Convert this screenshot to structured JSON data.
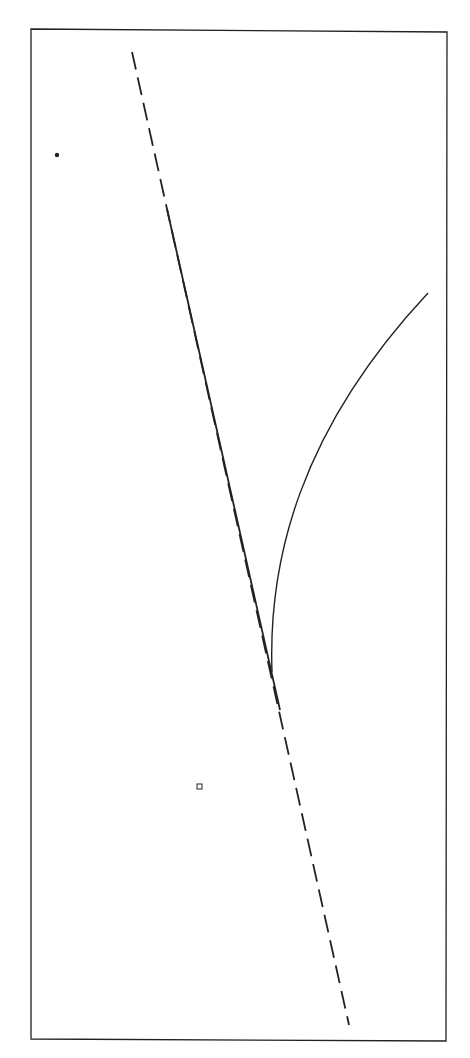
{
  "diagram": {
    "type": "geometric-figure",
    "background": "#ffffff",
    "ink_color": "#222222",
    "frame": {
      "points": [
        [
          31,
          29
        ],
        [
          447,
          32
        ],
        [
          446,
          1041
        ],
        [
          31,
          1039
        ]
      ],
      "stroke_width": 1.3
    },
    "dashed_line": {
      "x1": 132,
      "y1": 52,
      "x2": 349,
      "y2": 1025,
      "dash": "18 8",
      "stroke_width": 1.8
    },
    "solid_segment": {
      "x1": 167,
      "y1": 209,
      "x2": 280,
      "y2": 710,
      "stroke_width": 1.8
    },
    "curve": {
      "path": "M 272 672 C 268 560, 300 430, 428 293",
      "stroke_width": 1.4
    },
    "dot": {
      "cx": 57,
      "cy": 155,
      "r": 2.2
    },
    "square_marker": {
      "x": 197,
      "y": 784,
      "size": 5,
      "stroke_width": 1
    }
  }
}
